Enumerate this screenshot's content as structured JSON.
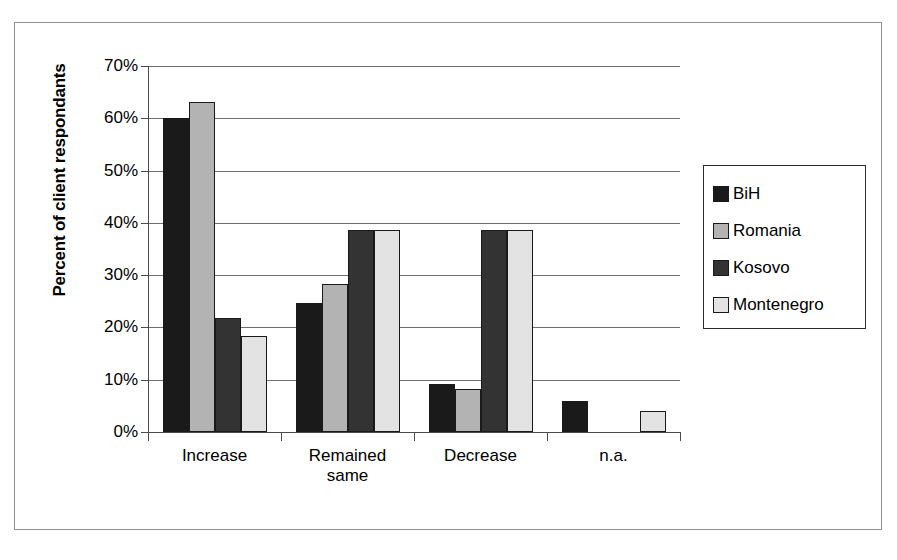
{
  "chart_data": {
    "type": "bar",
    "title": "",
    "subtitle": "",
    "xlabel": "",
    "ylabel": "Percent of client respondants",
    "categories": [
      "Increase",
      "Remained same",
      "Decrease",
      "n.a."
    ],
    "category_lines": [
      [
        "Increase"
      ],
      [
        "Remained",
        "same"
      ],
      [
        "Decrease"
      ],
      [
        "n.a."
      ]
    ],
    "series": [
      {
        "name": "BiH",
        "color": "#1a1a1a",
        "values": [
          60.0,
          24.7,
          9.1,
          6.0
        ]
      },
      {
        "name": "Romania",
        "color": "#b3b3b3",
        "values": [
          63.2,
          28.4,
          8.3,
          0.0
        ]
      },
      {
        "name": "Kosovo",
        "color": "#333333",
        "values": [
          21.8,
          38.7,
          38.7,
          0.0
        ]
      },
      {
        "name": "Montenegro",
        "color": "#e3e3e3",
        "values": [
          18.3,
          38.7,
          38.7,
          4.0
        ]
      }
    ],
    "ylim": [
      0,
      70
    ],
    "ytick_values": [
      0,
      10,
      20,
      30,
      40,
      50,
      60,
      70
    ],
    "ytick_labels": [
      "0%",
      "10%",
      "20%",
      "30%",
      "40%",
      "50%",
      "60%",
      "70%"
    ],
    "grid": true,
    "grid_axis": "y",
    "legend_position": "right",
    "value_suffix": "%"
  },
  "legend": {
    "items": [
      {
        "label": "BiH"
      },
      {
        "label": "Romania"
      },
      {
        "label": "Kosovo"
      },
      {
        "label": "Montenegro"
      }
    ]
  },
  "colors": {
    "bih": "#1a1a1a",
    "romania": "#b3b3b3",
    "kosovo": "#333333",
    "montenegro": "#e3e3e3",
    "gridline": "#6e6e6e",
    "axis": "#4a4a4a",
    "frame": "#8d8d8d",
    "background": "#ffffff"
  }
}
